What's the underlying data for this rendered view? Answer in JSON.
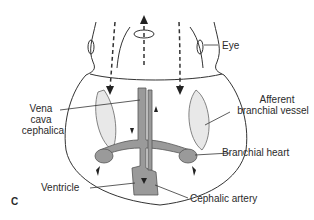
{
  "figure": {
    "panel_label": "C",
    "labels": {
      "eye": "Eye",
      "afferent_line1": "Afferent",
      "afferent_line2": "branchial vessel",
      "vena_line1": "Vena",
      "vena_line2": "cava",
      "vena_line3": "cephalica",
      "branchial_heart": "Branchial heart",
      "ventricle": "Ventricle",
      "cephalic_artery": "Cephalic artery"
    },
    "colors": {
      "line": "#333333",
      "vessel_fill": "#9a9a9a",
      "gill_fill": "#e6e6e6"
    }
  }
}
